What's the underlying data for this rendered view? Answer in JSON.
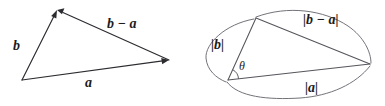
{
  "figure": {
    "background_color": "#ffffff",
    "stroke_color": "#2b2b30",
    "arc_color": "#6a6a72",
    "magnitude_stroke_color": "#55555c"
  },
  "left_diagram": {
    "name": "vector-triangle",
    "labels": {
      "vector_b": "b",
      "vector_a": "a",
      "vector_b_minus_a": "b − a"
    },
    "vertices": {
      "origin": [
        22,
        80
      ],
      "top": [
        57,
        10
      ],
      "right": [
        169,
        60
      ]
    },
    "vectors": [
      {
        "name": "b",
        "from": "origin",
        "to": "top",
        "arrowhead": "to"
      },
      {
        "name": "a",
        "from": "origin",
        "to": "right",
        "arrowhead": "to"
      },
      {
        "name": "b-a",
        "from": "right",
        "to": "top",
        "arrowhead": "to"
      }
    ]
  },
  "right_diagram": {
    "name": "magnitude-triangle",
    "labels": {
      "magnitude_b": "|b|",
      "magnitude_a": "|a|",
      "magnitude_b_minus_a": "|b − a|",
      "angle": "θ"
    },
    "vertices": {
      "origin": [
        228,
        80
      ],
      "top": [
        256,
        18
      ],
      "right": [
        370,
        64
      ]
    },
    "sides": [
      {
        "name": "b",
        "from": "origin",
        "to": "top"
      },
      {
        "name": "a",
        "from": "origin",
        "to": "right"
      },
      {
        "name": "b-a",
        "from": "top",
        "to": "right"
      }
    ],
    "arcs": [
      {
        "name": "arc-b",
        "label": "|b|"
      },
      {
        "name": "arc-a",
        "label": "|a|"
      },
      {
        "name": "arc-b-minus-a",
        "label": "|b − a|"
      }
    ],
    "angle_marker": {
      "at": "origin",
      "symbol": "θ"
    }
  }
}
